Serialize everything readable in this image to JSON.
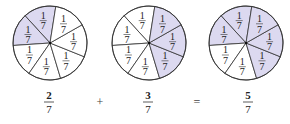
{
  "diagram": {
    "denominator": 7,
    "slice_label": {
      "numerator": "1",
      "denominator": "7"
    },
    "colors": {
      "shaded": "#dcd9f0",
      "unshaded": "#ffffff",
      "stroke": "#333333"
    },
    "start_angle_deg": 81,
    "circles": [
      {
        "id": "left",
        "cx": 50,
        "cy": 43,
        "r": 37,
        "shaded_slices": [
          0,
          1
        ],
        "fraction": {
          "numerator": "2",
          "denominator": "7"
        }
      },
      {
        "id": "middle",
        "cx": 149,
        "cy": 43,
        "r": 37,
        "shaded_slices": [
          4,
          5,
          6
        ],
        "fraction": {
          "numerator": "3",
          "denominator": "7"
        }
      },
      {
        "id": "right",
        "cx": 246,
        "cy": 43,
        "r": 37,
        "shaded_slices": [
          0,
          1,
          4,
          5,
          6
        ],
        "fraction": {
          "numerator": "5",
          "denominator": "7"
        }
      }
    ],
    "operators": [
      {
        "symbol": "+",
        "x": 100
      },
      {
        "symbol": "=",
        "x": 197
      }
    ]
  }
}
